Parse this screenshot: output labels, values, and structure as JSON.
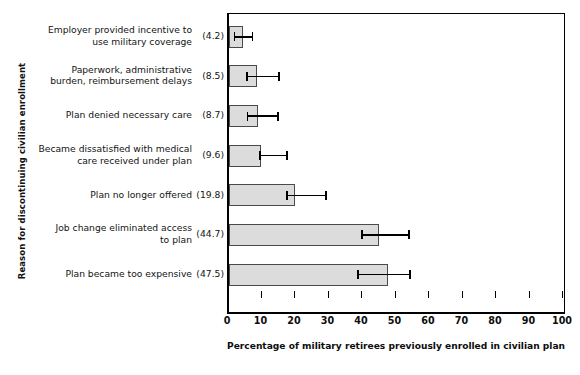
{
  "chart_data": {
    "type": "bar",
    "orientation": "horizontal",
    "title": "",
    "xlabel": "Percentage of military retirees previously enrolled in civilian plan",
    "ylabel": "Reason for discontinuing civilian enrollment",
    "xlim": [
      0,
      100
    ],
    "xticks": [
      0,
      10,
      20,
      30,
      40,
      50,
      60,
      70,
      80,
      90,
      100
    ],
    "grid": false,
    "legend": null,
    "categories": [
      "Employer provided incentive to use military coverage",
      "Paperwork, administrative burden, reimbursement delays",
      "Plan denied necessary care",
      "Became dissatisfied with medical care received under plan",
      "Plan no longer offered",
      "Job change eliminated access to plan",
      "Plan became too expensive"
    ],
    "category_lines": [
      [
        "Employer provided incentive to",
        "use military coverage"
      ],
      [
        "Paperwork, administrative",
        "burden, reimbursement delays"
      ],
      [
        "Plan denied necessary care"
      ],
      [
        "Became dissatisfied with medical",
        "care received under plan"
      ],
      [
        "Plan no longer offered"
      ],
      [
        "Job change eliminated access",
        "to plan"
      ],
      [
        "Plan became too expensive"
      ]
    ],
    "value_labels": [
      "(4.2)",
      "(8.5)",
      "(8.7)",
      "(9.6)",
      "(19.8)",
      "(44.7)",
      "(47.5)"
    ],
    "values": [
      4.2,
      8.5,
      8.7,
      9.6,
      19.8,
      44.7,
      47.5
    ],
    "error_low": [
      1.6,
      5.4,
      5.5,
      9.3,
      17.3,
      39.7,
      38.5
    ],
    "error_high": [
      7.0,
      14.9,
      14.6,
      17.3,
      29.0,
      53.7,
      54.0
    ],
    "bar_fill": "#dcdcdc",
    "bar_edge": "#4a4a4a",
    "error_color": "#000000",
    "axis_color": "#000000"
  }
}
